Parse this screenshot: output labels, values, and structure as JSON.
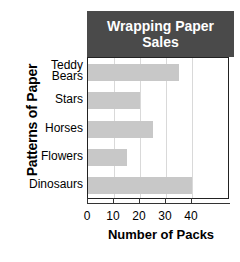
{
  "chart_data": {
    "type": "bar",
    "orientation": "horizontal",
    "title": "Wrapping Paper Sales",
    "title_line1": "Wrapping Paper",
    "title_line2": "Sales",
    "xlabel": "Number of Packs",
    "ylabel": "Patterns of Paper",
    "categories": [
      "Teddy Bears",
      "Stars",
      "Horses",
      "Flowers",
      "Dinosaurs"
    ],
    "category_lines": [
      [
        "Teddy",
        "Bears"
      ],
      [
        "Stars"
      ],
      [
        "Horses"
      ],
      [
        "Flowers"
      ],
      [
        "Dinosaurs"
      ]
    ],
    "values": [
      35,
      20,
      25,
      15,
      40
    ],
    "xlim": [
      0,
      45
    ],
    "xticks": [
      0,
      10,
      20,
      30,
      40
    ],
    "xtick_labels": [
      "0",
      "10",
      "20",
      "30",
      "40"
    ],
    "grid": true,
    "legend": false,
    "colors": {
      "bar": "#c8c8c8",
      "title_background": "#4a4a4a",
      "title_text": "#ffffff",
      "axis": "#333333",
      "gridline": "#d9d9d9",
      "text": "#000000",
      "background": "#ffffff"
    }
  }
}
